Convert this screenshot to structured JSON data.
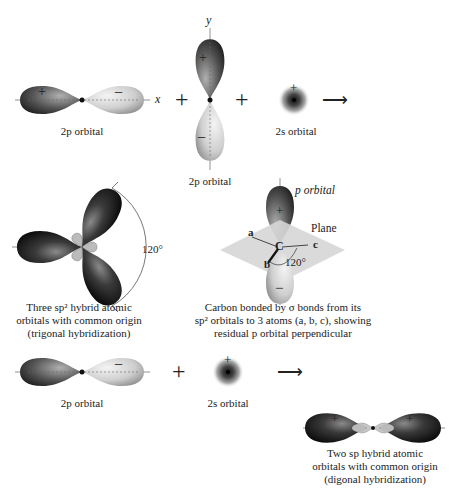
{
  "figure": {
    "row1": {
      "axis_x": "x",
      "axis_y": "y",
      "orbital_px_label": "2p orbital",
      "orbital_py_label": "2p orbital",
      "orbital_s_label": "2s orbital",
      "plus1": "+",
      "plus2": "+",
      "arrow": "⟶",
      "signs": {
        "px_left": "+",
        "px_right": "−",
        "py_top": "+",
        "py_bottom": "−",
        "s": "+"
      }
    },
    "row2": {
      "sp2_caption": [
        "Three sp² hybrid atomic",
        "orbitals with common origin",
        "(trigonal hybridization)"
      ],
      "sp2_angle": "120°",
      "carbon": {
        "p_orbital_label": "p orbital",
        "plane_label": "Plane",
        "atom_a": "a",
        "atom_b": "b",
        "atom_c": "c",
        "center": "C",
        "angle": "120°",
        "caption": [
          "Carbon bonded by σ bonds from its",
          "sp² orbitals to 3 atoms (a, b, c), showing",
          "residual p orbital perpendicular"
        ]
      }
    },
    "row3": {
      "orbital_p_label": "2p orbital",
      "orbital_s_label": "2s orbital",
      "plus": "+",
      "arrow": "⟶",
      "sp_caption": [
        "Two sp hybrid atomic",
        "orbitals with common origin",
        "(digonal hybridization)"
      ]
    },
    "colors": {
      "dark_lobe": "#1a1a1a",
      "light_lobe": "#d8d8d8",
      "plane": "#d9d9d9",
      "text": "#222222"
    }
  }
}
